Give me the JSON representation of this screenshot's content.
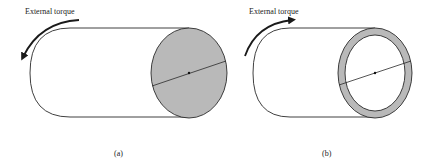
{
  "figures": [
    {
      "id": "a",
      "caption": "(a)",
      "annotation": "External torque",
      "section": "solid",
      "fill_color": "#b9b9b9"
    },
    {
      "id": "b",
      "caption": "(b)",
      "annotation": "External torque",
      "section": "hollow",
      "fill_color": "#b9b9b9"
    }
  ],
  "colors": {
    "stroke": "#2a2a2a",
    "background": "#ffffff"
  }
}
